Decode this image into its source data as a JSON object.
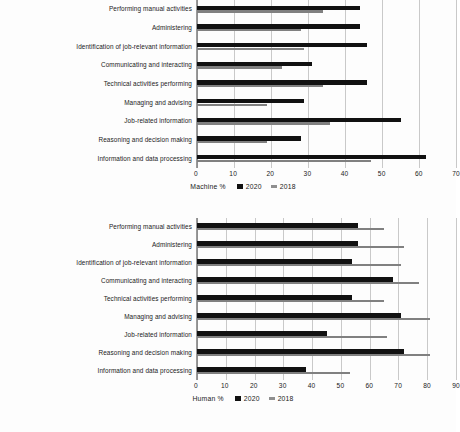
{
  "chart_data": [
    {
      "id": "machine",
      "type": "bar",
      "orientation": "horizontal",
      "title": "",
      "xlabel": "",
      "ylabel": "",
      "legend_title": "Machine %",
      "legend_position": "bottom",
      "grid": true,
      "xlim": [
        0,
        70
      ],
      "xticks": [
        0,
        10,
        20,
        30,
        40,
        50,
        60,
        70
      ],
      "categories": [
        "Performing manual activities",
        "Administering",
        "Identification of job-relevant information",
        "Communicating and interacting",
        "Technical activities performing",
        "Managing and advising",
        "Job-related information",
        "Reasoning and decision making",
        "Information and data processing"
      ],
      "series": [
        {
          "name": "2020",
          "color": "#111111",
          "values": [
            44,
            44,
            46,
            31,
            46,
            29,
            55,
            28,
            62
          ]
        },
        {
          "name": "2018",
          "color": "#808080",
          "values": [
            34,
            28,
            29,
            23,
            34,
            19,
            36,
            19,
            47
          ]
        }
      ]
    },
    {
      "id": "human",
      "type": "bar",
      "orientation": "horizontal",
      "title": "",
      "xlabel": "",
      "ylabel": "",
      "legend_title": "Human %",
      "legend_position": "bottom",
      "grid": true,
      "xlim": [
        0,
        90
      ],
      "xticks": [
        0,
        10,
        20,
        30,
        40,
        50,
        60,
        70,
        80,
        90
      ],
      "categories": [
        "Performing manual activities",
        "Administering",
        "Identification of job-relevant information",
        "Communicating and interacting",
        "Technical activities performing",
        "Managing and advising",
        "Job-related information",
        "Reasoning and decision making",
        "Information and data processing"
      ],
      "series": [
        {
          "name": "2020",
          "color": "#111111",
          "values": [
            56,
            56,
            54,
            68,
            54,
            71,
            45,
            72,
            38
          ]
        },
        {
          "name": "2018",
          "color": "#808080",
          "values": [
            65,
            72,
            71,
            77,
            65,
            81,
            66,
            81,
            53
          ]
        }
      ]
    }
  ]
}
